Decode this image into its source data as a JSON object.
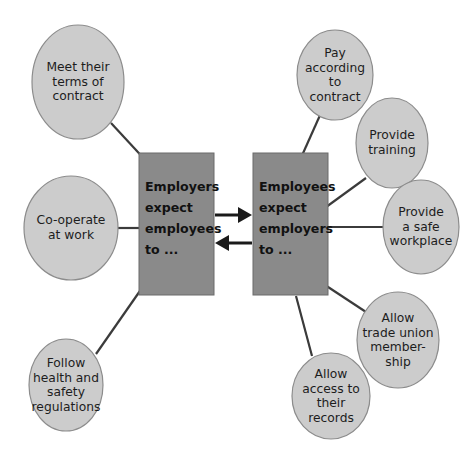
{
  "diagram": {
    "colors": {
      "ellipse_fill": "#cccccc",
      "ellipse_stroke": "#8c8c8c",
      "box_fill": "#8a8a8a",
      "box_stroke": "#6b6b6b",
      "connector": "#3b3b3b",
      "arrow": "#1a1a1a",
      "background": "#ffffff",
      "text": "#1d1d1d"
    },
    "boxes": [
      {
        "id": "employers-expect",
        "text": "Employers\nexpect\nemployees\nto ...",
        "x": 139,
        "y": 153,
        "width": 75,
        "height": 142
      },
      {
        "id": "employees-expect",
        "text": "Employees\nexpect\nemployers\nto ...",
        "x": 253,
        "y": 153,
        "width": 75,
        "height": 142
      }
    ],
    "arrows": [
      {
        "id": "employers-to-employees",
        "direction": "right",
        "label": ""
      },
      {
        "id": "employees-to-employers",
        "direction": "left",
        "label": ""
      }
    ],
    "ellipses": [
      {
        "id": "meet-terms-of-contract",
        "text": "Meet their\nterms of\ncontract",
        "cx": 78,
        "cy": 82,
        "rx": 46,
        "ry": 57,
        "side": "left",
        "connects_to": "employers-expect"
      },
      {
        "id": "co-operate-at-work",
        "text": "Co-operate\nat work",
        "cx": 71,
        "cy": 228,
        "rx": 47,
        "ry": 52,
        "side": "left",
        "connects_to": "employers-expect"
      },
      {
        "id": "follow-health-and-safety",
        "text": "Follow\nhealth and\nsafety\nregulations",
        "cx": 66,
        "cy": 385,
        "rx": 37,
        "ry": 46,
        "side": "left",
        "connects_to": "employers-expect"
      },
      {
        "id": "pay-according-to-contract",
        "text": "Pay\naccording\nto\ncontract",
        "cx": 335,
        "cy": 75,
        "rx": 38,
        "ry": 45,
        "side": "right",
        "connects_to": "employees-expect"
      },
      {
        "id": "provide-training",
        "text": "Provide\ntraining",
        "cx": 392,
        "cy": 143,
        "rx": 36,
        "ry": 45,
        "side": "right",
        "connects_to": "employees-expect"
      },
      {
        "id": "provide-safe-workplace",
        "text": "Provide\na safe\nworkplace",
        "cx": 421,
        "cy": 227,
        "rx": 38,
        "ry": 47,
        "side": "right",
        "connects_to": "employees-expect"
      },
      {
        "id": "allow-trade-union-membership",
        "text": "Allow\ntrade union\nmember-\nship",
        "cx": 398,
        "cy": 340,
        "rx": 41,
        "ry": 48,
        "side": "right",
        "connects_to": "employees-expect"
      },
      {
        "id": "allow-access-to-records",
        "text": "Allow\naccess to\ntheir\nrecords",
        "cx": 331,
        "cy": 396,
        "rx": 39,
        "ry": 43,
        "side": "right",
        "connects_to": "employees-expect"
      }
    ]
  }
}
